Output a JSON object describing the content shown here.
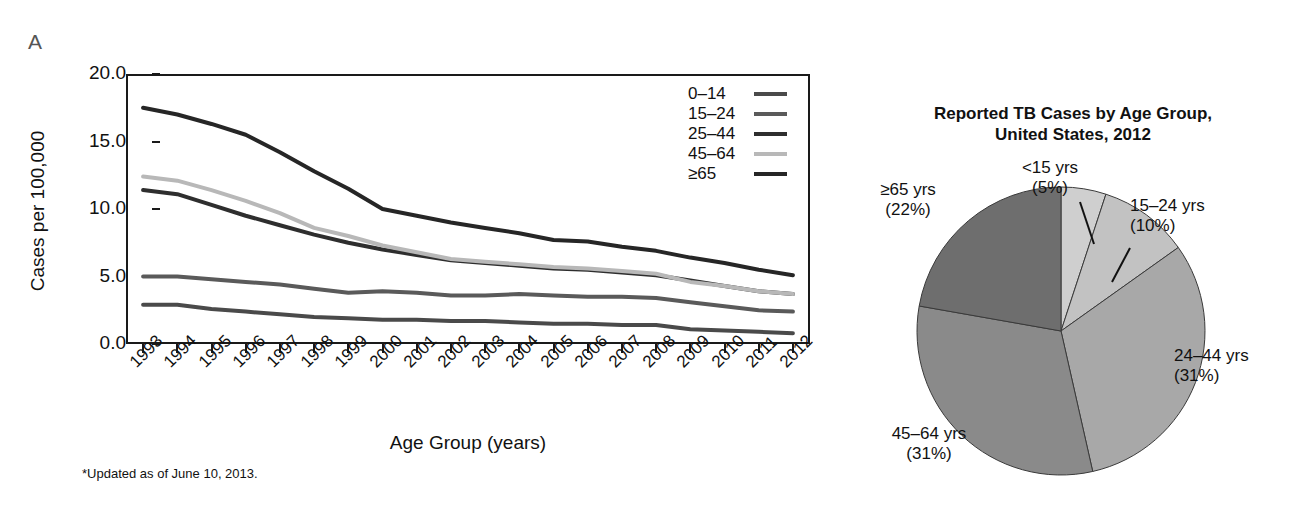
{
  "panels": {
    "a_letter": "A",
    "b_letter": "B"
  },
  "footnote": "*Updated as of June 10, 2013.",
  "chart_data": [
    {
      "type": "line",
      "panel": "A",
      "title": "",
      "xlabel": "Age Group (years)",
      "ylabel": "Cases per 100,000",
      "ylim": [
        0,
        20
      ],
      "yticks": [
        "0.0",
        "5.0",
        "10.0",
        "15.0",
        "20.0"
      ],
      "ytick_values": [
        0,
        5,
        10,
        15,
        20
      ],
      "grid": false,
      "legend_position": "top-right",
      "categories": [
        "1993",
        "1994",
        "1995",
        "1996",
        "1997",
        "1998",
        "1999",
        "2000",
        "2001",
        "2002",
        "2003",
        "2004",
        "2005",
        "2006",
        "2007",
        "2008",
        "2009",
        "2010",
        "2011",
        "2012"
      ],
      "series": [
        {
          "name": "0–14",
          "color": "#4a4a4a",
          "values": [
            2.9,
            2.9,
            2.6,
            2.4,
            2.2,
            2.0,
            1.9,
            1.8,
            1.8,
            1.7,
            1.7,
            1.6,
            1.5,
            1.5,
            1.4,
            1.4,
            1.1,
            1.0,
            0.9,
            0.8
          ]
        },
        {
          "name": "15–24",
          "color": "#5a5a5a",
          "values": [
            5.0,
            5.0,
            4.8,
            4.6,
            4.4,
            4.1,
            3.8,
            3.9,
            3.8,
            3.6,
            3.6,
            3.7,
            3.6,
            3.5,
            3.5,
            3.4,
            3.1,
            2.8,
            2.5,
            2.4
          ]
        },
        {
          "name": "25–44",
          "color": "#2e2e2e",
          "values": [
            11.4,
            11.1,
            10.3,
            9.5,
            8.8,
            8.1,
            7.5,
            7.0,
            6.6,
            6.2,
            6.0,
            5.8,
            5.6,
            5.5,
            5.3,
            5.1,
            4.7,
            4.3,
            3.9,
            3.7
          ]
        },
        {
          "name": "45–64",
          "color": "#b8b8b8",
          "values": [
            12.4,
            12.1,
            11.4,
            10.6,
            9.7,
            8.6,
            8.0,
            7.3,
            6.8,
            6.3,
            6.1,
            5.9,
            5.7,
            5.6,
            5.4,
            5.2,
            4.6,
            4.3,
            3.9,
            3.7
          ]
        },
        {
          "name": "≥65",
          "color": "#262626",
          "values": [
            17.5,
            17.0,
            16.3,
            15.5,
            14.2,
            12.8,
            11.5,
            10.0,
            9.5,
            9.0,
            8.6,
            8.2,
            7.7,
            7.6,
            7.2,
            6.9,
            6.4,
            6.0,
            5.5,
            5.1
          ]
        }
      ]
    },
    {
      "type": "pie",
      "panel": "B",
      "title_line1": "Reported TB Cases by Age Group,",
      "title_line2": "United States, 2012",
      "labels": [
        "<15 yrs",
        "15–24 yrs",
        "24–44 yrs",
        "45–64 yrs",
        "≥65 yrs"
      ],
      "percent_labels": [
        "(5%)",
        "(10%)",
        "(31%)",
        "(31%)",
        "(22%)"
      ],
      "values": [
        5,
        10,
        31,
        31,
        22
      ],
      "colors": [
        "#cfcfcf",
        "#c2c2c2",
        "#a8a8a8",
        "#8a8a8a",
        "#6e6e6e"
      ]
    }
  ]
}
